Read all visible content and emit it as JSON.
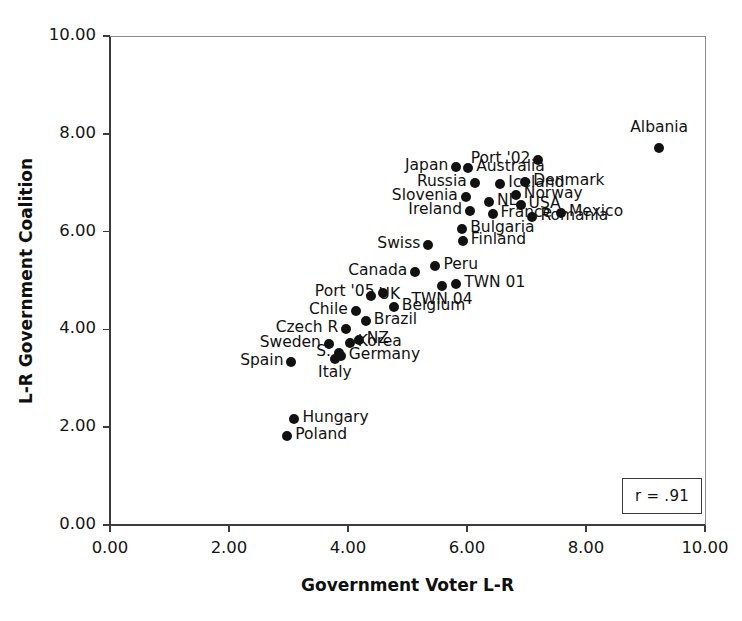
{
  "chart_data": {
    "type": "scatter",
    "title": "",
    "xlabel": "Government Voter L-R",
    "ylabel": "L-R Government Coalition",
    "xlim": [
      0,
      10
    ],
    "ylim": [
      0,
      10
    ],
    "xticks": [
      "0.00",
      "2.00",
      "4.00",
      "6.00",
      "8.00",
      "10.00"
    ],
    "xtick_values": [
      0,
      2,
      4,
      6,
      8,
      10
    ],
    "yticks": [
      "0.00",
      "2.00",
      "4.00",
      "6.00",
      "8.00",
      "10.00"
    ],
    "ytick_values": [
      0,
      2,
      4,
      6,
      8,
      10
    ],
    "grid": false,
    "legend": null,
    "annotation": "r = .91",
    "points": [
      {
        "label": "Albania",
        "x": 9.23,
        "y": 7.7,
        "label_pos": "above"
      },
      {
        "label": "Port '02",
        "x": 7.2,
        "y": 7.47,
        "label_pos": "left"
      },
      {
        "label": "Australia",
        "x": 6.02,
        "y": 7.3,
        "label_pos": "right"
      },
      {
        "label": "Japan",
        "x": 5.82,
        "y": 7.32,
        "label_pos": "left"
      },
      {
        "label": "Russia",
        "x": 6.13,
        "y": 7.0,
        "label_pos": "left"
      },
      {
        "label": "Iceland",
        "x": 6.56,
        "y": 6.97,
        "label_pos": "right"
      },
      {
        "label": "Denmark",
        "x": 6.98,
        "y": 7.02,
        "label_pos": "right"
      },
      {
        "label": "Norway",
        "x": 6.82,
        "y": 6.75,
        "label_pos": "right"
      },
      {
        "label": "Slovenia",
        "x": 5.98,
        "y": 6.7,
        "label_pos": "left"
      },
      {
        "label": "NL",
        "x": 6.37,
        "y": 6.6,
        "label_pos": "right"
      },
      {
        "label": "USA",
        "x": 6.9,
        "y": 6.55,
        "label_pos": "right"
      },
      {
        "label": "Ireland",
        "x": 6.05,
        "y": 6.42,
        "label_pos": "left"
      },
      {
        "label": "France",
        "x": 6.43,
        "y": 6.35,
        "label_pos": "right"
      },
      {
        "label": "Mexico",
        "x": 7.58,
        "y": 6.38,
        "label_pos": "right"
      },
      {
        "label": "Romania",
        "x": 7.1,
        "y": 6.3,
        "label_pos": "right"
      },
      {
        "label": "Bulgaria",
        "x": 5.92,
        "y": 6.05,
        "label_pos": "right"
      },
      {
        "label": "Swiss",
        "x": 5.35,
        "y": 5.72,
        "label_pos": "left"
      },
      {
        "label": "Finland",
        "x": 5.93,
        "y": 5.8,
        "label_pos": "right"
      },
      {
        "label": "Canada",
        "x": 5.13,
        "y": 5.18,
        "label_pos": "left"
      },
      {
        "label": "Peru",
        "x": 5.47,
        "y": 5.3,
        "label_pos": "right"
      },
      {
        "label": "TWN 01",
        "x": 5.82,
        "y": 4.92,
        "label_pos": "right"
      },
      {
        "label": "TWN 04",
        "x": 5.58,
        "y": 4.88,
        "label_pos": "below"
      },
      {
        "label": "Port '05",
        "x": 4.58,
        "y": 4.75,
        "label_pos": "left"
      },
      {
        "label": "UK",
        "x": 4.38,
        "y": 4.68,
        "label_pos": "right"
      },
      {
        "label": "Belgium",
        "x": 4.77,
        "y": 4.45,
        "label_pos": "right"
      },
      {
        "label": "Chile",
        "x": 4.13,
        "y": 4.38,
        "label_pos": "left"
      },
      {
        "label": "Brazil",
        "x": 4.3,
        "y": 4.17,
        "label_pos": "right"
      },
      {
        "label": "Czech R",
        "x": 3.97,
        "y": 4.0,
        "label_pos": "left"
      },
      {
        "label": "NZ",
        "x": 4.18,
        "y": 3.78,
        "label_pos": "right"
      },
      {
        "label": "Korea",
        "x": 4.03,
        "y": 3.72,
        "label_pos": "right"
      },
      {
        "label": "Sweden",
        "x": 3.68,
        "y": 3.7,
        "label_pos": "left"
      },
      {
        "label": "S.",
        "x": 3.85,
        "y": 3.52,
        "label_pos": "left"
      },
      {
        "label": "Germany",
        "x": 3.88,
        "y": 3.45,
        "label_pos": "right"
      },
      {
        "label": "Italy",
        "x": 3.78,
        "y": 3.4,
        "label_pos": "below"
      },
      {
        "label": "Spain",
        "x": 3.05,
        "y": 3.33,
        "label_pos": "left"
      },
      {
        "label": "Hungary",
        "x": 3.1,
        "y": 2.17,
        "label_pos": "right"
      },
      {
        "label": "Poland",
        "x": 2.98,
        "y": 1.82,
        "label_pos": "right"
      }
    ]
  },
  "axes": {
    "x_axis_name": "Government Voter L-R",
    "y_axis_name": "L-R Government Coalition"
  },
  "annotation_box": {
    "text": "r = .91"
  }
}
